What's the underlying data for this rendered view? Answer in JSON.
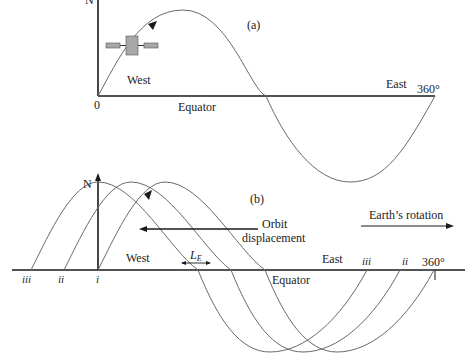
{
  "panel_a": {
    "label": "(a)",
    "north": "N",
    "origin": "0",
    "west": "West",
    "east": "East",
    "end": "360°",
    "equator": "Equator"
  },
  "panel_b": {
    "label": "(b)",
    "north": "N",
    "west": "West",
    "east": "East",
    "equator": "Equator",
    "end": "360°",
    "orbit_line1": "Orbit",
    "orbit_line2": "displacement",
    "earth_rotation": "Earth’s rotation",
    "le_main": "L",
    "le_sub": "E",
    "left_marks": [
      "iii",
      "ii",
      "i"
    ],
    "right_marks": [
      "iii",
      "ii"
    ]
  },
  "colors": {
    "curve": "#6a6a6a",
    "axis": "#1a1a1a",
    "satellite": "#a8a8a8"
  }
}
